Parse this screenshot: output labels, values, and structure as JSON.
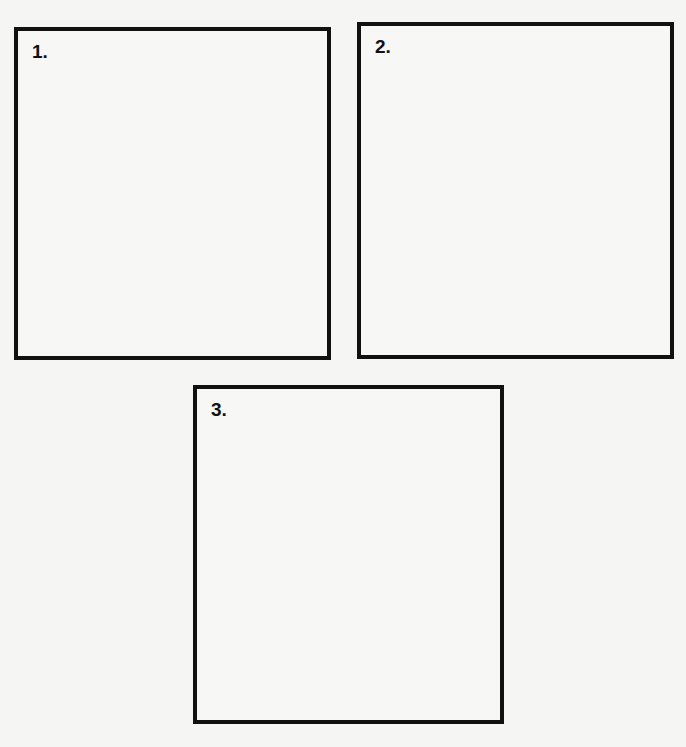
{
  "panels": [
    {
      "label": "1."
    },
    {
      "label": "2."
    },
    {
      "label": "3."
    }
  ],
  "colors": {
    "background": "#f5f5f3",
    "border": "#111111",
    "text": "#111111"
  }
}
